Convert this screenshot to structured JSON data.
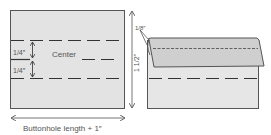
{
  "diagram": {
    "labels": {
      "quarter_top": "1/4″",
      "quarter_bottom": "1/4″",
      "center": "Center",
      "width_dimension": "Buttonhole length + 1″",
      "height_dimension": "1 1/2″",
      "fold_depth": "1/8″"
    },
    "colors": {
      "patch_fill": "#e3e3e3",
      "flap_fill": "#cfcfcf",
      "outline": "#555555",
      "dash": "#333333",
      "dimension": "#666666"
    }
  }
}
